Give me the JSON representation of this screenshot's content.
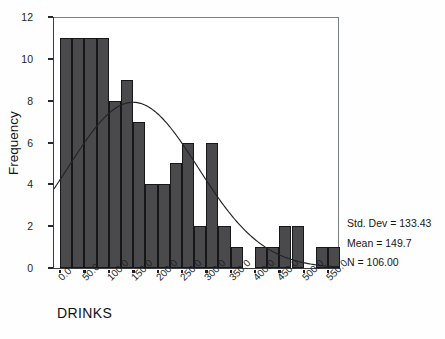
{
  "chart_data": {
    "type": "bar",
    "title": "",
    "xlabel": "DRINKS",
    "ylabel": "Frequency",
    "xlim": [
      -12.5,
      572.5
    ],
    "ylim": [
      0,
      12
    ],
    "grid": false,
    "legend": "none",
    "bin_width": 25,
    "x_tick_labels": [
      "0.0",
      "50.0",
      "100.0",
      "150.0",
      "200.0",
      "250.0",
      "300.0",
      "350.0",
      "400.0",
      "450.0",
      "500.0",
      "550.0"
    ],
    "x_tick_values": [
      0,
      50,
      100,
      150,
      200,
      250,
      300,
      350,
      400,
      450,
      500,
      550
    ],
    "y_tick_labels": [
      "0",
      "2",
      "4",
      "6",
      "8",
      "10",
      "12"
    ],
    "y_tick_values": [
      0,
      2,
      4,
      6,
      8,
      10,
      12
    ],
    "bin_centers": [
      12.5,
      37.5,
      62.5,
      87.5,
      112.5,
      137.5,
      162.5,
      187.5,
      212.5,
      237.5,
      262.5,
      287.5,
      312.5,
      337.5,
      362.5,
      387.5,
      412.5,
      437.5,
      462.5,
      487.5,
      512.5,
      537.5,
      562.5
    ],
    "bin_starts": [
      0,
      25,
      50,
      75,
      100,
      125,
      150,
      175,
      200,
      225,
      250,
      275,
      300,
      325,
      350,
      375,
      400,
      425,
      450,
      475,
      500,
      525,
      550
    ],
    "values": [
      11,
      11,
      11,
      11,
      8,
      9,
      7,
      4,
      4,
      5,
      6,
      2,
      6,
      2,
      1,
      0,
      1,
      1,
      2,
      2,
      0,
      1,
      1
    ],
    "overlay": {
      "type": "normal-curve",
      "mean": 149.7,
      "std_dev": 133.43,
      "n": 106,
      "bin_width": 25
    },
    "colors": {
      "bar_fill": "#4a4a4c",
      "bar_edge": "#17171a",
      "curve": "#222428",
      "axis": "#3a3d42",
      "text": "#15171a",
      "background": "#ffffff"
    }
  },
  "stats": {
    "std_dev_label": "Std. Dev = 133.43",
    "mean_label": "Mean = 149.7",
    "n_label": "N = 106.00"
  }
}
